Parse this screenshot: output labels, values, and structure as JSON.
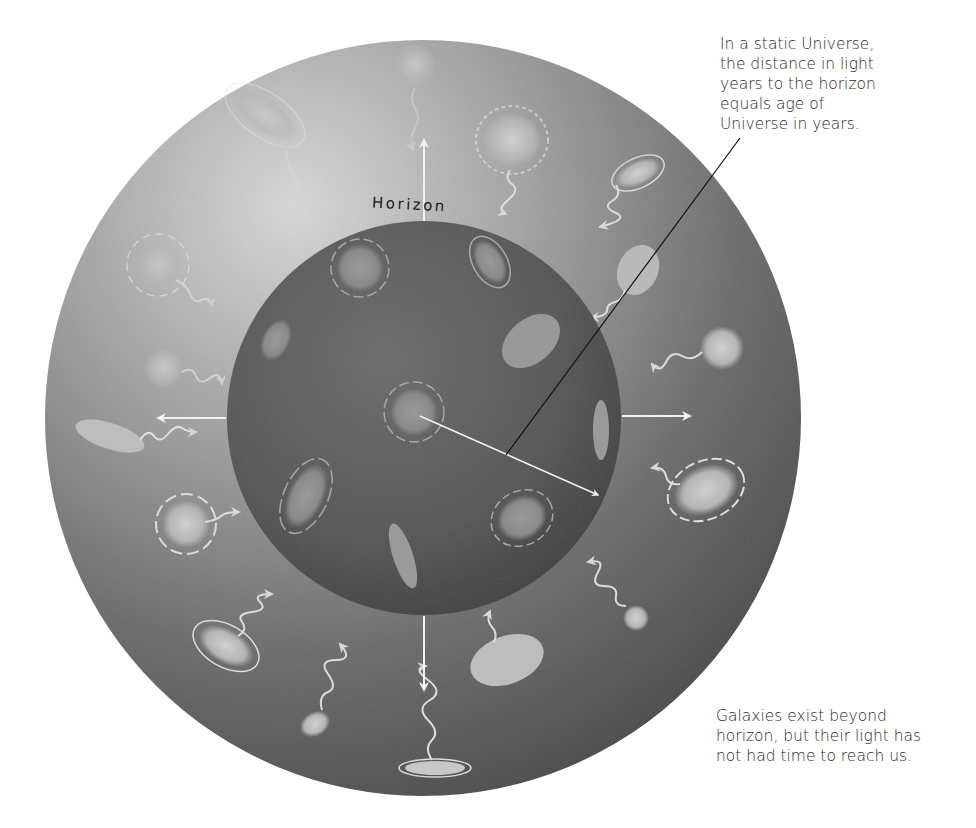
{
  "diagram": {
    "horizon_label": "Horizon",
    "colors": {
      "background": "#ffffff",
      "outer_sphere_light": "#c9c9c9",
      "outer_sphere_dark": "#4a4a4a",
      "inner_sphere": "#555555",
      "inner_sphere_dark": "#3c3c3c",
      "galaxy": "#b8b8b8",
      "arrow": "#f2f2f2",
      "leader_line": "#111111",
      "text": "#2a2a2a"
    },
    "outer_circle": {
      "cx": 423,
      "cy": 418,
      "r": 378
    },
    "inner_circle": {
      "cx": 424,
      "cy": 418,
      "r": 197
    },
    "annotations": {
      "top": {
        "lines": [
          "In a static Universe,",
          "the distance in light",
          "years to the horizon",
          "equals age of",
          "Universe in years."
        ]
      },
      "bottom": {
        "lines": [
          "Galaxies exist beyond",
          "horizon, but their light has",
          "not had time to reach us."
        ]
      }
    }
  }
}
